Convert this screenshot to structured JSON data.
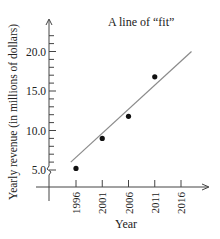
{
  "chart_data": {
    "type": "scatter",
    "title": "A line of “fit”",
    "xlabel": "Year",
    "ylabel": "Yearly revenue (in millions of dollars)",
    "x_ticks": [
      "1996",
      "2001",
      "2006",
      "2011",
      "2016"
    ],
    "y_ticks": [
      "5.0",
      "10.0",
      "15.0",
      "20.0"
    ],
    "ylim": [
      5.0,
      22.0
    ],
    "xlim": [
      1991,
      2019
    ],
    "grid": false,
    "legend": null,
    "axis_break_y": true,
    "series": [
      {
        "name": "Revenue",
        "type": "scatter",
        "x": [
          1996,
          2001,
          2006,
          2011
        ],
        "y": [
          5.2,
          9.0,
          11.8,
          16.8
        ]
      },
      {
        "name": "Line of fit",
        "type": "line",
        "x": [
          1995,
          2018
        ],
        "y": [
          6.0,
          20.0
        ]
      }
    ],
    "colors": {
      "points": "#111111",
      "fit_line": "#888888",
      "axes": "#444444"
    }
  }
}
